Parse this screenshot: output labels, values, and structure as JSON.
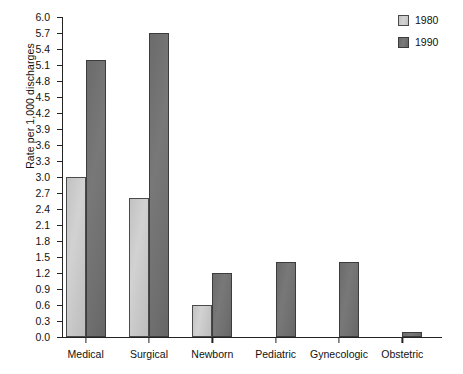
{
  "chart_data": {
    "type": "bar",
    "title": "",
    "subtitle": "",
    "xlabel": "",
    "ylabel": "Rate per 1,000 discharges",
    "ylim": [
      0.0,
      6.0
    ],
    "ytick_step": 0.3,
    "ytick_labels": [
      "0.0",
      "0.3",
      "0.6",
      "0.9",
      "1.2",
      "1.5",
      "1.8",
      "2.1",
      "2.4",
      "2.7",
      "3.0",
      "3.3",
      "3.6",
      "3.9",
      "4.2",
      "4.5",
      "4.8",
      "5.1",
      "5.4",
      "5.7",
      "6.0"
    ],
    "grid": false,
    "legend_position": "top-right",
    "categories": [
      "Medical",
      "Surgical",
      "Newborn",
      "Pediatric",
      "Gynecologic",
      "Obstetric"
    ],
    "series": [
      {
        "name": "1980",
        "color": "#cccccc",
        "values": [
          3.0,
          2.6,
          0.6,
          0.0,
          0.0,
          0.0
        ]
      },
      {
        "name": "1990",
        "color": "#707070",
        "values": [
          5.2,
          5.7,
          1.2,
          1.4,
          1.4,
          0.1
        ]
      }
    ]
  },
  "legend": {
    "entries": [
      {
        "label": "1980",
        "swatch": "legend-swatch-1980"
      },
      {
        "label": "1990",
        "swatch": "legend-swatch-1990"
      }
    ]
  }
}
